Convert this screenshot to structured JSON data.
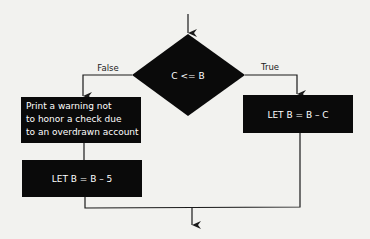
{
  "diagram": {
    "type": "flowchart",
    "decision": {
      "label": "C  <=  B"
    },
    "branches": {
      "false_label": "False",
      "true_label": "True"
    },
    "false_steps": [
      {
        "lines": [
          "Print a warning not",
          "to honor a check due",
          "to an overdrawn account"
        ]
      },
      {
        "lines": [
          "LET B = B – 5"
        ]
      }
    ],
    "true_steps": [
      {
        "lines": [
          "LET B = B – C"
        ]
      }
    ],
    "colors": {
      "shape_fill": "#0a0a0a",
      "line": "#1a1a1a",
      "text_on_shape": "#ffffff",
      "background": "#f2f2ef"
    }
  }
}
